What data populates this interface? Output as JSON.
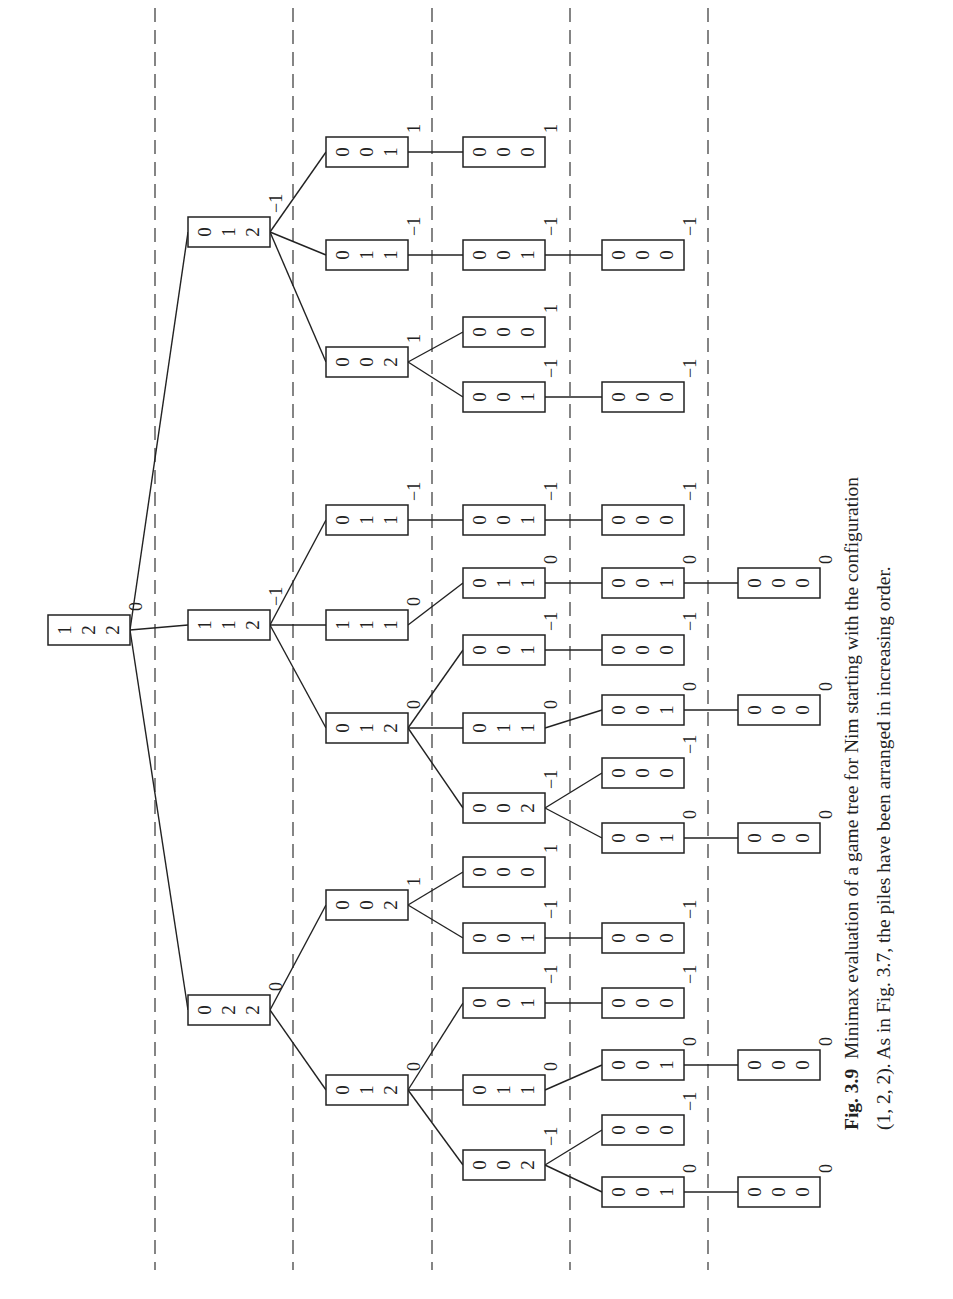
{
  "figure": {
    "orientation": "rotated-90-ccw",
    "level_separators_x": [
      155,
      293,
      432,
      570,
      708
    ],
    "level_columns_x": [
      48,
      188,
      326,
      463,
      602,
      738
    ],
    "node_width": 82,
    "node_height": 30
  },
  "tree": {
    "nodes": [
      {
        "id": "r",
        "level": 0,
        "y": 630,
        "piles": [
          1,
          2,
          2
        ],
        "value": "0"
      },
      {
        "id": "a",
        "parent": "r",
        "level": 1,
        "y": 232,
        "piles": [
          0,
          1,
          2
        ],
        "value": "−1"
      },
      {
        "id": "b",
        "parent": "r",
        "level": 1,
        "y": 625,
        "piles": [
          1,
          1,
          2
        ],
        "value": "−1"
      },
      {
        "id": "c",
        "parent": "r",
        "level": 1,
        "y": 1010,
        "piles": [
          0,
          2,
          2
        ],
        "value": "0"
      },
      {
        "id": "a1",
        "parent": "a",
        "level": 2,
        "y": 152,
        "piles": [
          0,
          0,
          1
        ],
        "value": "1"
      },
      {
        "id": "a2",
        "parent": "a",
        "level": 2,
        "y": 255,
        "piles": [
          0,
          1,
          1
        ],
        "value": "−1"
      },
      {
        "id": "a3",
        "parent": "a",
        "level": 2,
        "y": 362,
        "piles": [
          0,
          0,
          2
        ],
        "value": "1"
      },
      {
        "id": "b1",
        "parent": "b",
        "level": 2,
        "y": 520,
        "piles": [
          0,
          1,
          1
        ],
        "value": "−1"
      },
      {
        "id": "b2",
        "parent": "b",
        "level": 2,
        "y": 625,
        "piles": [
          1,
          1,
          1
        ],
        "value": "0"
      },
      {
        "id": "b3",
        "parent": "b",
        "level": 2,
        "y": 728,
        "piles": [
          0,
          1,
          2
        ],
        "value": "0"
      },
      {
        "id": "c1",
        "parent": "c",
        "level": 2,
        "y": 905,
        "piles": [
          0,
          0,
          2
        ],
        "value": "1"
      },
      {
        "id": "c2",
        "parent": "c",
        "level": 2,
        "y": 1090,
        "piles": [
          0,
          1,
          2
        ],
        "value": "0"
      },
      {
        "id": "a1a",
        "parent": "a1",
        "level": 3,
        "y": 152,
        "piles": [
          0,
          0,
          0
        ],
        "value": "1"
      },
      {
        "id": "a2a",
        "parent": "a2",
        "level": 3,
        "y": 255,
        "piles": [
          0,
          0,
          1
        ],
        "value": "−1"
      },
      {
        "id": "a3a",
        "parent": "a3",
        "level": 3,
        "y": 332,
        "piles": [
          0,
          0,
          0
        ],
        "value": "1"
      },
      {
        "id": "a3b",
        "parent": "a3",
        "level": 3,
        "y": 397,
        "piles": [
          0,
          0,
          1
        ],
        "value": "−1"
      },
      {
        "id": "b1a",
        "parent": "b1",
        "level": 3,
        "y": 520,
        "piles": [
          0,
          0,
          1
        ],
        "value": "−1"
      },
      {
        "id": "b2a",
        "parent": "b2",
        "level": 3,
        "y": 583,
        "piles": [
          0,
          1,
          1
        ],
        "value": "0"
      },
      {
        "id": "b3a",
        "parent": "b3",
        "level": 3,
        "y": 650,
        "piles": [
          0,
          0,
          1
        ],
        "value": "−1"
      },
      {
        "id": "b3b",
        "parent": "b3",
        "level": 3,
        "y": 728,
        "piles": [
          0,
          1,
          1
        ],
        "value": "0"
      },
      {
        "id": "b3c",
        "parent": "b3",
        "level": 3,
        "y": 808,
        "piles": [
          0,
          0,
          2
        ],
        "value": "−1"
      },
      {
        "id": "c1a",
        "parent": "c1",
        "level": 3,
        "y": 872,
        "piles": [
          0,
          0,
          0
        ],
        "value": "1"
      },
      {
        "id": "c1b",
        "parent": "c1",
        "level": 3,
        "y": 938,
        "piles": [
          0,
          0,
          1
        ],
        "value": "−1"
      },
      {
        "id": "c2a",
        "parent": "c2",
        "level": 3,
        "y": 1003,
        "piles": [
          0,
          0,
          1
        ],
        "value": "−1"
      },
      {
        "id": "c2b",
        "parent": "c2",
        "level": 3,
        "y": 1090,
        "piles": [
          0,
          1,
          1
        ],
        "value": "0"
      },
      {
        "id": "c2c",
        "parent": "c2",
        "level": 3,
        "y": 1165,
        "piles": [
          0,
          0,
          2
        ],
        "value": "−1"
      },
      {
        "id": "a2a1",
        "parent": "a2a",
        "level": 4,
        "y": 255,
        "piles": [
          0,
          0,
          0
        ],
        "value": "−1"
      },
      {
        "id": "a3b1",
        "parent": "a3b",
        "level": 4,
        "y": 397,
        "piles": [
          0,
          0,
          0
        ],
        "value": "−1"
      },
      {
        "id": "b1a1",
        "parent": "b1a",
        "level": 4,
        "y": 520,
        "piles": [
          0,
          0,
          0
        ],
        "value": "−1"
      },
      {
        "id": "b2a1",
        "parent": "b2a",
        "level": 4,
        "y": 583,
        "piles": [
          0,
          0,
          1
        ],
        "value": "0"
      },
      {
        "id": "b3a1",
        "parent": "b3a",
        "level": 4,
        "y": 650,
        "piles": [
          0,
          0,
          0
        ],
        "value": "−1"
      },
      {
        "id": "b3b1",
        "parent": "b3b",
        "level": 4,
        "y": 710,
        "piles": [
          0,
          0,
          1
        ],
        "value": "0"
      },
      {
        "id": "b3c1",
        "parent": "b3c",
        "level": 4,
        "y": 773,
        "piles": [
          0,
          0,
          0
        ],
        "value": "−1"
      },
      {
        "id": "b3c2",
        "parent": "b3c",
        "level": 4,
        "y": 838,
        "piles": [
          0,
          0,
          1
        ],
        "value": "0"
      },
      {
        "id": "c1b1",
        "parent": "c1b",
        "level": 4,
        "y": 938,
        "piles": [
          0,
          0,
          0
        ],
        "value": "−1"
      },
      {
        "id": "c2a1",
        "parent": "c2a",
        "level": 4,
        "y": 1003,
        "piles": [
          0,
          0,
          0
        ],
        "value": "−1"
      },
      {
        "id": "c2b1",
        "parent": "c2b",
        "level": 4,
        "y": 1065,
        "piles": [
          0,
          0,
          1
        ],
        "value": "0"
      },
      {
        "id": "c2c1",
        "parent": "c2c",
        "level": 4,
        "y": 1130,
        "piles": [
          0,
          0,
          0
        ],
        "value": "−1"
      },
      {
        "id": "c2c2",
        "parent": "c2c",
        "level": 4,
        "y": 1192,
        "piles": [
          0,
          0,
          1
        ],
        "value": "0"
      },
      {
        "id": "b2a1a",
        "parent": "b2a1",
        "level": 5,
        "y": 583,
        "piles": [
          0,
          0,
          0
        ],
        "value": "0"
      },
      {
        "id": "b3b1a",
        "parent": "b3b1",
        "level": 5,
        "y": 710,
        "piles": [
          0,
          0,
          0
        ],
        "value": "0"
      },
      {
        "id": "b3c2a",
        "parent": "b3c2",
        "level": 5,
        "y": 838,
        "piles": [
          0,
          0,
          0
        ],
        "value": "0"
      },
      {
        "id": "c2b1a",
        "parent": "c2b1",
        "level": 5,
        "y": 1065,
        "piles": [
          0,
          0,
          0
        ],
        "value": "0"
      },
      {
        "id": "c2c2a",
        "parent": "c2c2",
        "level": 5,
        "y": 1192,
        "piles": [
          0,
          0,
          0
        ],
        "value": "0"
      }
    ]
  },
  "caption": {
    "label": "Fig. 3.9",
    "line1": "Minimax evaluation of a game tree for Nim starting with the configuration",
    "line2": "(1, 2, 2). As in Fig. 3.7, the piles have been arranged in increasing order."
  },
  "colors": {
    "ink": "#222222",
    "background": "#ffffff"
  }
}
